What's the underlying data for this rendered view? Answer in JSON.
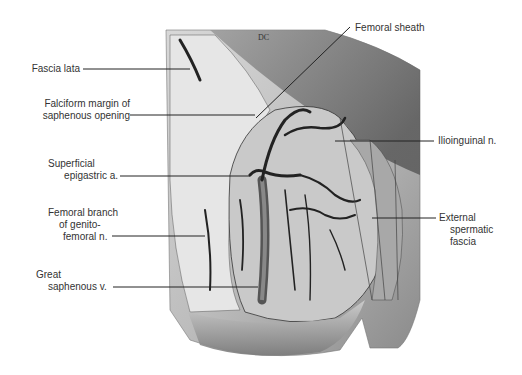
{
  "figure": {
    "type": "anatomical illustration",
    "signature": "DC",
    "labels_left": [
      {
        "id": "fascia-lata",
        "lines": [
          "Fascia lata"
        ]
      },
      {
        "id": "falciform-margin",
        "lines": [
          "Falciform margin of",
          "saphenous opening"
        ]
      },
      {
        "id": "superficial-epigastric",
        "lines": [
          "Superficial",
          "epigastric a."
        ]
      },
      {
        "id": "femoral-branch",
        "lines": [
          "Femoral branch",
          "of genito-",
          "femoral n."
        ]
      },
      {
        "id": "great-saphenous",
        "lines": [
          "Great",
          "saphenous v."
        ]
      }
    ],
    "labels_right": [
      {
        "id": "femoral-sheath",
        "lines": [
          "Femoral sheath"
        ]
      },
      {
        "id": "ilioinguinal",
        "lines": [
          "Ilioinguinal n."
        ]
      },
      {
        "id": "external-spermatic",
        "lines": [
          "External",
          "spermatic",
          "fascia"
        ]
      }
    ]
  }
}
